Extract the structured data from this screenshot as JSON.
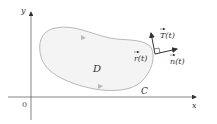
{
  "diagram": {
    "axes": {
      "x_label": "x",
      "y_label": "y",
      "origin_label": "0"
    },
    "region_label": "D",
    "curve_label": "C",
    "position_vector_label": "r(t)",
    "tangent_vector_label": "T(t)",
    "normal_vector_label": "n(t)",
    "colors": {
      "region_fill": "#f4f4f4",
      "curve_stroke": "#b8b8b8",
      "axis_stroke": "#555555",
      "vector_stroke": "#333333"
    }
  }
}
